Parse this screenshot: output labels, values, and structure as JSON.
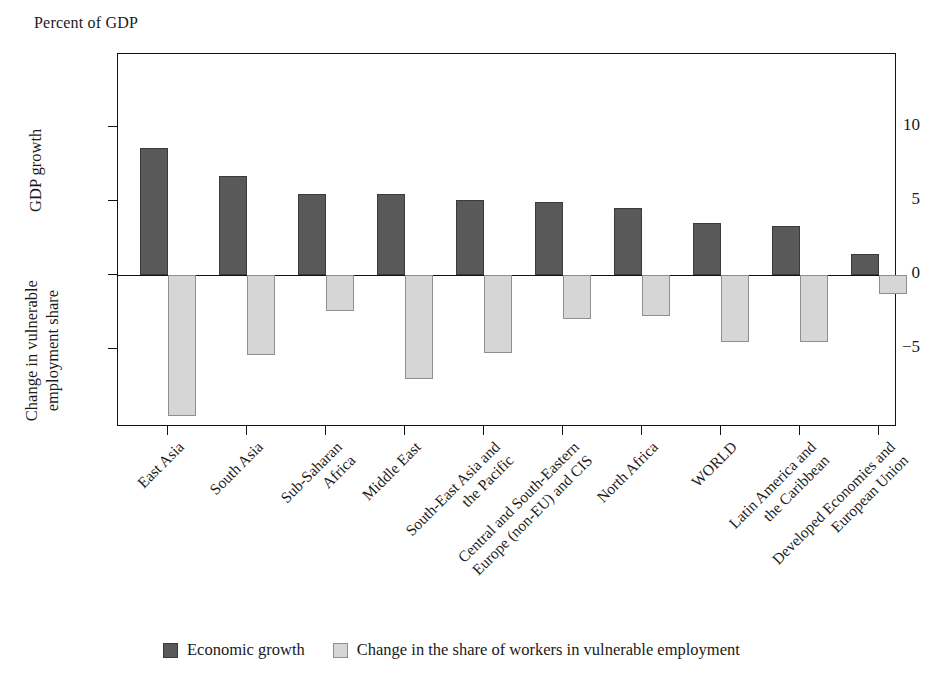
{
  "figure": {
    "unit_caption": "Percent of GDP"
  },
  "axes": {
    "y_title_top": "GDP growth",
    "y_title_bottom_line1": "Change in vulnerable",
    "y_title_bottom_line2": "employment share",
    "y_ticks": [
      "10",
      "5",
      "0",
      "−5"
    ]
  },
  "legend": {
    "items": [
      {
        "label": "Economic growth",
        "color": "#595959"
      },
      {
        "label": "Change in the share of workers in vulnerable employment",
        "color": "#d6d6d6"
      }
    ]
  },
  "chart_data": {
    "type": "bar",
    "title": "",
    "subtitle": "",
    "xlabel": "",
    "ylabel": "Percent of GDP",
    "ylim": [
      -10.4,
      14.9
    ],
    "yticks": [
      10,
      5,
      0,
      -5
    ],
    "grid": false,
    "legend_position": "bottom",
    "orientation": "vertical",
    "bar_layout": "grouped",
    "categories": [
      "East Asia",
      "South Asia",
      "Sub-Saharan Africa",
      "Middle East",
      "South-East Asia and the Pacific",
      "Central and South-Eastern Europe (non-EU) and CIS",
      "North Africa",
      "WORLD",
      "Latin America and the Caribbean",
      "Developed Economies and European Union"
    ],
    "category_label_lines": [
      [
        "East Asia"
      ],
      [
        "South Asia"
      ],
      [
        "Sub-Saharan",
        "Africa"
      ],
      [
        "Middle East"
      ],
      [
        "South-East Asia and",
        "the Pacific"
      ],
      [
        "Central and South-Eastern",
        "Europe (non-EU) and CIS"
      ],
      [
        "North Africa"
      ],
      [
        "WORLD"
      ],
      [
        "Latin America and",
        "the Caribbean"
      ],
      [
        "Developed Economies and",
        "European Union"
      ]
    ],
    "series": [
      {
        "name": "Economic growth",
        "color": "#595959",
        "values": [
          8.6,
          6.7,
          5.5,
          5.5,
          5.1,
          4.9,
          4.5,
          3.5,
          3.3,
          1.4
        ]
      },
      {
        "name": "Change in the share of workers in vulnerable employment",
        "color": "#d6d6d6",
        "values": [
          -9.5,
          -5.4,
          -2.4,
          -7.0,
          -5.3,
          -3.0,
          -2.8,
          -4.5,
          -4.5,
          -1.3
        ]
      }
    ]
  }
}
